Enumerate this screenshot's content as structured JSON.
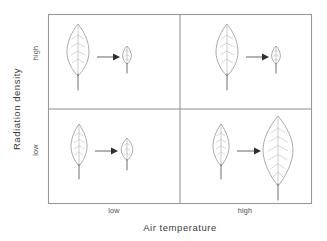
{
  "figure": {
    "type": "conceptual-diagram",
    "axes": {
      "x": {
        "title": "Air temperature",
        "tick_labels": [
          "low",
          "high"
        ]
      },
      "y": {
        "title": "Radiation density",
        "tick_labels": [
          "high",
          "low"
        ]
      }
    },
    "colors": {
      "frame": "#9a9a9a",
      "divider": "#8e8e8e",
      "leaf_outline": "#8d8d8d",
      "leaf_vein": "#b0b0b0",
      "arrow": "#2e2e2e",
      "background": "#ffffff",
      "text": "#3a3a3a"
    },
    "panels": [
      {
        "id": "top-left",
        "radiation_density": "high",
        "air_temperature": "low",
        "start_leaf": "large",
        "end_leaf": "very-small",
        "outcome": "strong reduction in leaf size"
      },
      {
        "id": "top-right",
        "radiation_density": "high",
        "air_temperature": "high",
        "start_leaf": "large",
        "end_leaf": "very-small",
        "outcome": "strong reduction in leaf size"
      },
      {
        "id": "bottom-left",
        "radiation_density": "low",
        "air_temperature": "low",
        "start_leaf": "medium",
        "end_leaf": "small",
        "outcome": "moderate reduction in leaf size"
      },
      {
        "id": "bottom-right",
        "radiation_density": "low",
        "air_temperature": "high",
        "start_leaf": "medium",
        "end_leaf": "very-large",
        "outcome": "large increase in leaf size"
      }
    ]
  }
}
